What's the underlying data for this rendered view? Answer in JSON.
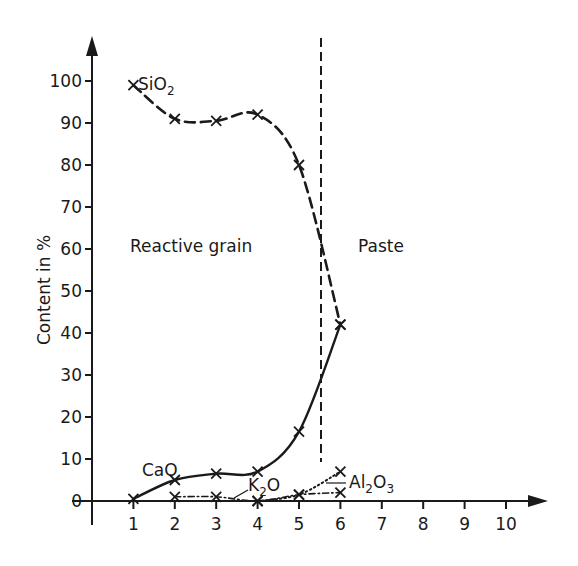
{
  "chart_data": {
    "type": "line",
    "title": "",
    "xlabel": "",
    "ylabel": "Content in %",
    "xlim": [
      0,
      11
    ],
    "ylim": [
      0,
      110
    ],
    "grid": false,
    "x_ticks": [
      1,
      2,
      3,
      4,
      5,
      6,
      7,
      8,
      9,
      10
    ],
    "y_ticks": [
      0,
      10,
      20,
      30,
      40,
      50,
      60,
      70,
      80,
      90,
      100
    ],
    "series": [
      {
        "name": "SiO2",
        "label": "SiO₂",
        "style": "dashed",
        "x": [
          1,
          2,
          3,
          4,
          5,
          6
        ],
        "values": [
          99,
          91,
          90.5,
          92,
          80,
          42
        ]
      },
      {
        "name": "CaO",
        "label": "CaO",
        "style": "solid",
        "x": [
          1,
          2,
          3,
          4,
          5,
          6
        ],
        "values": [
          0.5,
          5,
          6.5,
          7,
          16.5,
          42
        ]
      },
      {
        "name": "K2O",
        "label": "K₂O",
        "style": "dash-dot",
        "x": [
          2,
          3,
          4,
          5,
          6
        ],
        "values": [
          1,
          1,
          0,
          1.5,
          2
        ]
      },
      {
        "name": "Al2O3",
        "label": "Al₂O₃",
        "style": "dotted",
        "x": [
          4,
          5,
          6
        ],
        "values": [
          0,
          1.5,
          7
        ]
      }
    ],
    "annotations": [
      {
        "text": "Reactive grain",
        "x": 2.4,
        "y": 61
      },
      {
        "text": "Paste",
        "x": 6.3,
        "y": 61
      }
    ],
    "boundary_line": {
      "x": 5.45,
      "style": "dashed",
      "label": "grain / paste boundary"
    }
  },
  "labels": {
    "ylabel": "Content in %",
    "region_left": "Reactive grain",
    "region_right": "Paste",
    "sio2": "SiO",
    "sio2_sub": "2",
    "cao": "CaO",
    "k2o": "K",
    "k2o_sub": "2",
    "k2o_tail": "O",
    "al2o3_a": "Al",
    "al2o3_sub1": "2",
    "al2o3_b": "O",
    "al2o3_sub2": "3"
  },
  "axes": {
    "x_tick_labels": [
      "1",
      "2",
      "3",
      "4",
      "5",
      "6",
      "7",
      "8",
      "9",
      "10"
    ],
    "y_tick_labels": [
      "0",
      "10",
      "20",
      "30",
      "40",
      "50",
      "60",
      "70",
      "80",
      "90",
      "100"
    ]
  }
}
